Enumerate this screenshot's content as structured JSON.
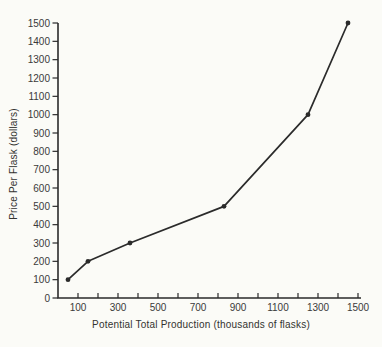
{
  "colors": {
    "background": "#fbfbf7",
    "ink": "#2b2b2b",
    "text": "#3a3a3a"
  },
  "chart_data": {
    "type": "line",
    "title": "",
    "xlabel": "Potential Total Production (thousands of flasks)",
    "ylabel": "Price Per Flask (dollars)",
    "x": [
      50,
      150,
      360,
      830,
      1250,
      1450
    ],
    "y": [
      100,
      200,
      300,
      500,
      1000,
      1500
    ],
    "xlim": [
      0,
      1500
    ],
    "ylim": [
      0,
      1500
    ],
    "x_minor_tick_interval": 100,
    "x_tick_labels": [
      100,
      300,
      500,
      700,
      900,
      1100,
      1300,
      1500
    ],
    "y_tick_labels": [
      0,
      100,
      200,
      300,
      400,
      500,
      600,
      700,
      800,
      900,
      1000,
      1100,
      1200,
      1300,
      1400,
      1500
    ],
    "grid": false,
    "legend_position": "none",
    "marker": "dot",
    "line_color": "#2b2b2b"
  }
}
